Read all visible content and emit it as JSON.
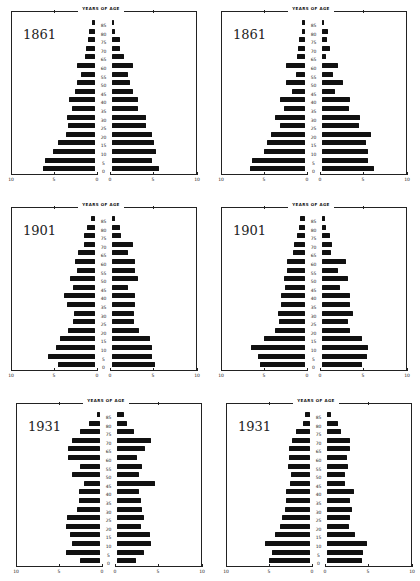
{
  "axis_title": "YEARS OF AGE",
  "age_labels": [
    "85",
    "80",
    "75",
    "70",
    "65",
    "60",
    "55",
    "50",
    "45",
    "40",
    "35",
    "30",
    "25",
    "20",
    "15",
    "10",
    "5",
    "0"
  ],
  "x_ticks_left": [
    "10",
    "5",
    "0"
  ],
  "x_ticks_right": [
    "0",
    "5",
    "10"
  ],
  "panels": [
    {
      "year": "1861"
    },
    {
      "year": "1861"
    },
    {
      "year": "1901"
    },
    {
      "year": "1901"
    },
    {
      "year": "1931"
    },
    {
      "year": "1931"
    }
  ],
  "chart_data": [
    {
      "type": "bar",
      "subtype": "population-pyramid",
      "title": "1861",
      "ylabel": "YEARS OF AGE",
      "categories": [
        "85",
        "80",
        "75",
        "70",
        "65",
        "60",
        "55",
        "50",
        "45",
        "40",
        "35",
        "30",
        "25",
        "20",
        "15",
        "10",
        "5",
        "0"
      ],
      "xlim": [
        0,
        10
      ],
      "x_ticks": [
        10,
        5,
        0,
        0,
        5,
        10
      ],
      "series": [
        {
          "name": "left",
          "values": [
            0.3,
            0.7,
            0.8,
            1.1,
            1.2,
            2.1,
            1.6,
            2.1,
            2.3,
            3.0,
            2.7,
            3.3,
            3.1,
            3.4,
            4.3,
            4.9,
            5.8,
            6.1
          ]
        },
        {
          "name": "right",
          "values": [
            0.2,
            0.3,
            0.9,
            0.9,
            1.4,
            2.4,
            1.9,
            2.1,
            2.4,
            3.0,
            3.0,
            3.9,
            4.0,
            4.6,
            4.9,
            5.1,
            4.7,
            5.5
          ]
        }
      ]
    },
    {
      "type": "bar",
      "subtype": "population-pyramid",
      "title": "1861",
      "ylabel": "YEARS OF AGE",
      "categories": [
        "85",
        "80",
        "75",
        "70",
        "65",
        "60",
        "55",
        "50",
        "45",
        "40",
        "35",
        "30",
        "25",
        "20",
        "15",
        "10",
        "5",
        "0"
      ],
      "xlim": [
        0,
        10
      ],
      "x_ticks": [
        10,
        5,
        0,
        0,
        5,
        10
      ],
      "series": [
        {
          "name": "left",
          "values": [
            0.3,
            0.4,
            0.7,
            0.8,
            0.9,
            2.2,
            1.1,
            2.2,
            1.5,
            2.9,
            2.5,
            3.5,
            2.9,
            4.0,
            4.4,
            4.8,
            6.2,
            6.4
          ]
        },
        {
          "name": "right",
          "values": [
            0.1,
            0.7,
            0.6,
            0.9,
            0.5,
            1.9,
            1.3,
            2.4,
            1.5,
            3.3,
            3.1,
            4.4,
            4.3,
            5.7,
            5.1,
            5.4,
            5.3,
            6.0
          ]
        }
      ]
    },
    {
      "type": "bar",
      "subtype": "population-pyramid",
      "title": "1901",
      "ylabel": "YEARS OF AGE",
      "categories": [
        "85",
        "80",
        "75",
        "70",
        "65",
        "60",
        "55",
        "50",
        "45",
        "40",
        "35",
        "30",
        "25",
        "20",
        "15",
        "10",
        "5",
        "0"
      ],
      "xlim": [
        0,
        10
      ],
      "x_ticks": [
        10,
        5,
        0,
        0,
        5,
        10
      ],
      "series": [
        {
          "name": "left",
          "values": [
            0.5,
            0.9,
            1.3,
            1.3,
            2.0,
            2.3,
            2.1,
            2.9,
            2.6,
            3.6,
            3.2,
            2.5,
            2.6,
            3.1,
            4.1,
            4.5,
            5.5,
            4.3
          ]
        },
        {
          "name": "right",
          "values": [
            0.3,
            0.9,
            1.0,
            2.4,
            1.9,
            2.7,
            2.7,
            3.0,
            1.9,
            2.7,
            2.7,
            2.5,
            2.5,
            3.1,
            4.4,
            4.7,
            4.7,
            5.0
          ]
        }
      ]
    },
    {
      "type": "bar",
      "subtype": "population-pyramid",
      "title": "1901",
      "ylabel": "YEARS OF AGE",
      "categories": [
        "85",
        "80",
        "75",
        "70",
        "65",
        "60",
        "55",
        "50",
        "45",
        "40",
        "35",
        "30",
        "25",
        "20",
        "15",
        "10",
        "5",
        "0"
      ],
      "xlim": [
        0,
        10
      ],
      "x_ticks": [
        10,
        5,
        0,
        0,
        5,
        10
      ],
      "series": [
        {
          "name": "left",
          "values": [
            0.6,
            0.7,
            0.9,
            1.3,
            1.4,
            2.1,
            2.1,
            2.4,
            2.3,
            2.8,
            2.8,
            3.1,
            3.0,
            3.5,
            4.8,
            6.3,
            5.5,
            5.2
          ]
        },
        {
          "name": "right",
          "values": [
            0.3,
            0.5,
            0.9,
            1.2,
            1.1,
            2.8,
            1.9,
            3.0,
            2.1,
            3.2,
            3.2,
            3.6,
            3.0,
            3.2,
            4.6,
            5.4,
            5.2,
            4.6
          ]
        }
      ]
    },
    {
      "type": "bar",
      "subtype": "population-pyramid",
      "title": "1931",
      "ylabel": "YEARS OF AGE",
      "categories": [
        "85",
        "80",
        "75",
        "70",
        "65",
        "60",
        "55",
        "50",
        "45",
        "40",
        "35",
        "30",
        "25",
        "20",
        "15",
        "10",
        "5",
        "0"
      ],
      "xlim": [
        0,
        10
      ],
      "x_ticks": [
        10,
        5,
        0,
        0,
        5,
        10
      ],
      "series": [
        {
          "name": "left",
          "values": [
            0.4,
            1.3,
            2.3,
            3.2,
            3.7,
            3.7,
            2.3,
            3.2,
            1.9,
            2.5,
            2.4,
            2.7,
            3.8,
            3.9,
            3.5,
            3.3,
            3.9,
            2.3
          ]
        },
        {
          "name": "right",
          "values": [
            0.8,
            1.2,
            2.0,
            4.0,
            3.2,
            2.3,
            2.9,
            2.5,
            4.4,
            2.5,
            2.8,
            2.9,
            3.1,
            2.8,
            3.8,
            4.0,
            3.1,
            2.2
          ]
        }
      ]
    },
    {
      "type": "bar",
      "subtype": "population-pyramid",
      "title": "1931",
      "ylabel": "YEARS OF AGE",
      "categories": [
        "85",
        "80",
        "75",
        "70",
        "65",
        "60",
        "55",
        "50",
        "45",
        "40",
        "35",
        "30",
        "25",
        "20",
        "15",
        "10",
        "5",
        "0"
      ],
      "xlim": [
        0,
        10
      ],
      "x_ticks": [
        10,
        5,
        0,
        0,
        5,
        10
      ],
      "series": [
        {
          "name": "left",
          "values": [
            0.6,
            0.8,
            1.6,
            2.1,
            2.5,
            2.4,
            2.6,
            2.2,
            2.3,
            2.8,
            2.8,
            2.9,
            3.2,
            3.5,
            4.1,
            5.2,
            4.4,
            4.8
          ]
        },
        {
          "name": "right",
          "values": [
            0.5,
            1.3,
            1.6,
            2.7,
            2.7,
            2.3,
            2.4,
            2.1,
            2.1,
            3.1,
            2.7,
            2.9,
            2.7,
            2.6,
            3.3,
            4.6,
            4.2,
            4.1
          ]
        }
      ]
    }
  ]
}
